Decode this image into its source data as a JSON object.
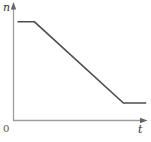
{
  "figure": {
    "y_axis_label": "n",
    "x_axis_label": "t",
    "origin_label": "0"
  },
  "colors": {
    "axis": "#9e9e9e",
    "arrowhead": "#666666",
    "curve": "#4d4d4d",
    "background": "#ffffff"
  },
  "chart_data": {
    "type": "line",
    "title": "",
    "xlabel": "t",
    "ylabel": "n",
    "xlim": [
      0,
      1
    ],
    "ylim": [
      0,
      1
    ],
    "grid": false,
    "legend": null,
    "series": [
      {
        "name": "n(t)",
        "x": [
          0.03,
          0.157,
          0.82,
          0.99
        ],
        "y": [
          0.84,
          0.84,
          0.149,
          0.149
        ]
      }
    ]
  }
}
